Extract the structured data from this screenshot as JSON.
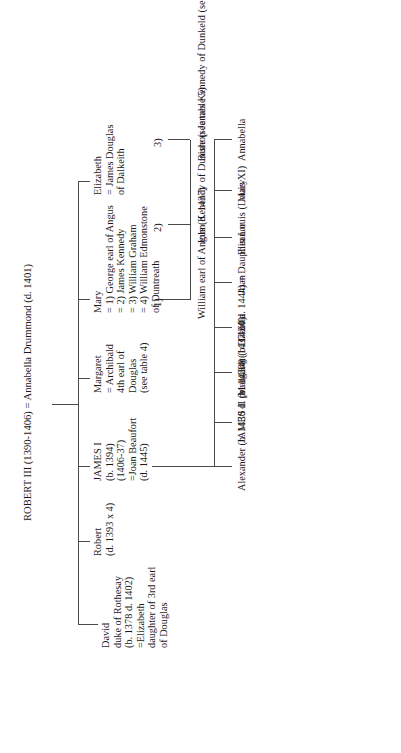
{
  "chart_title": "Genealogical table: ROBERT III and descendants",
  "root": {
    "line1": "ROBERT III (1390-1406)",
    "line2": "= Annabella Drummond (d. 1401)"
  },
  "generation2": [
    {
      "name": "David",
      "lines": [
        "David",
        "duke of Rothesay",
        "(b. 1378  d. 1402)",
        "=Elizabeth",
        "daughter of 3rd earl",
        "of Douglas"
      ]
    },
    {
      "name": "Robert",
      "lines": [
        "Robert",
        "(d. 1393 x 4)"
      ]
    },
    {
      "name": "James I",
      "lines": [
        "JAMES I",
        "(b. 1394)",
        "(1406-37)",
        "=Joan Beaufort",
        "(d. 1445)"
      ]
    },
    {
      "name": "Margaret",
      "lines": [
        "Margaret",
        "= Archibald",
        "4th earl of",
        "Douglas",
        "(see table 4)"
      ]
    },
    {
      "name": "Mary",
      "lines": [
        "Mary",
        "= 1) George earl of Angus",
        "= 2) James Kennedy",
        "= 3) William Graham",
        "= 4) William Edmonstone",
        "        of Duntreath"
      ]
    },
    {
      "name": "Elizabeth",
      "lines": [
        "Elizabeth",
        "= James Douglas",
        "of Dalkeith"
      ]
    }
  ],
  "james_i_children": [
    {
      "lines": [
        "Alexander",
        "(b. 1430",
        "d. pre 1434)"
      ]
    },
    {
      "lines": [
        "JAMES II",
        "(b. 1430)",
        "(1437-60)"
      ]
    },
    {
      "lines": [
        "Margaret",
        "(b. 1424  d. 1444)",
        "= Dauphin Louis",
        "(Louis XI)"
      ]
    },
    {
      "lines": [
        "Isabella"
      ]
    },
    {
      "lines": [
        "Joan"
      ]
    },
    {
      "lines": [
        "Eleanor"
      ]
    },
    {
      "lines": [
        "Mary"
      ]
    },
    {
      "lines": [
        "Annabella"
      ]
    }
  ],
  "mary_children": [
    {
      "marriage": "1)",
      "lines": [
        "William",
        "earl of Angus",
        "(d. 1437)"
      ]
    },
    {
      "marriage": "2)",
      "lines": [
        "John Kenendy",
        "of Dunure",
        "(see table 5)"
      ]
    },
    {
      "marriage": "3)",
      "lines": [
        "Bishop James Kennedy",
        "of Dunkeld",
        "(see table 5)"
      ]
    }
  ],
  "colors": {
    "line": "#4a4a4a",
    "text": "#1a1a1a",
    "background": "#ffffff"
  }
}
